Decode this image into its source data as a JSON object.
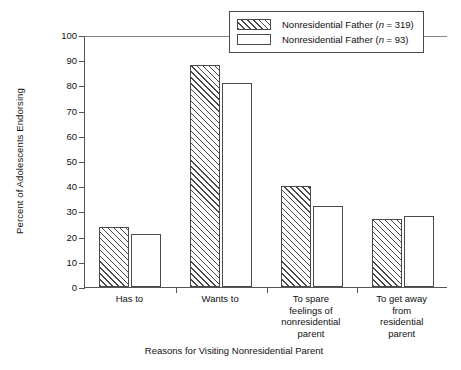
{
  "chart_data": {
    "type": "bar",
    "title": "",
    "xlabel": "Reasons for Visiting Nonresidential Parent",
    "ylabel": "Percent of Adolescents Endorsing",
    "ylim": [
      0,
      100
    ],
    "ytick_step": 10,
    "yticks": [
      0,
      10,
      20,
      30,
      40,
      50,
      60,
      70,
      80,
      90,
      100
    ],
    "grid": false,
    "legend_position": "top-right",
    "categories": [
      "Has to",
      "Wants to",
      "To spare\nfeelings of\nnonresidential\nparent",
      "To get away\nfrom\nresidential\nparent"
    ],
    "category_lines": [
      [
        "Has to"
      ],
      [
        "Wants to"
      ],
      [
        "To spare",
        "feelings of",
        "nonresidential",
        "parent"
      ],
      [
        "To get away",
        "from",
        "residential",
        "parent"
      ]
    ],
    "series": [
      {
        "name": "Nonresidential Father (n = 319)",
        "label_prefix": "Nonresidential Father (",
        "n_symbol": "n",
        "n_value": " = 319)",
        "fill": "hatched",
        "values": [
          24,
          88,
          40,
          27
        ]
      },
      {
        "name": "Nonresidential Father (n = 93)",
        "label_prefix": "Nonresidential Father (",
        "n_symbol": "n",
        "n_value": " = 93)",
        "fill": "open",
        "values": [
          21,
          81,
          32,
          28
        ]
      }
    ],
    "colors": {
      "axis": "#4a4a4a",
      "bar_outline": "#4a4a4a",
      "hatch": "#4a4a4a",
      "open_fill": "#ffffff",
      "text": "#111111"
    }
  }
}
